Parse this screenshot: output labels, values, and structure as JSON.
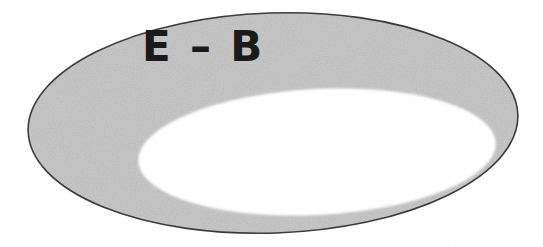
{
  "figure": {
    "background_color": "#ffffff",
    "width": 543,
    "height": 247
  },
  "shapes": {
    "outer_ellipse": {
      "name": "outer-ellipse",
      "cx": 273,
      "cy": 123,
      "rx": 245,
      "ry": 110,
      "rotation_deg": -2,
      "fill_color": "#c9c9c9",
      "stroke_color": "#3a3a3a",
      "stroke_width": 1.6
    },
    "inner_ellipse": {
      "name": "inner-ellipse",
      "cx": 317,
      "cy": 152,
      "rx": 179,
      "ry": 63,
      "rotation_deg": -3,
      "fill_color": "#ffffff",
      "stroke_color": "none",
      "stroke_width": 0
    }
  },
  "labels": {
    "region": {
      "text": "E – B",
      "x": 142,
      "y": 61,
      "font_size": 42,
      "color": "#1a1a1a"
    }
  }
}
